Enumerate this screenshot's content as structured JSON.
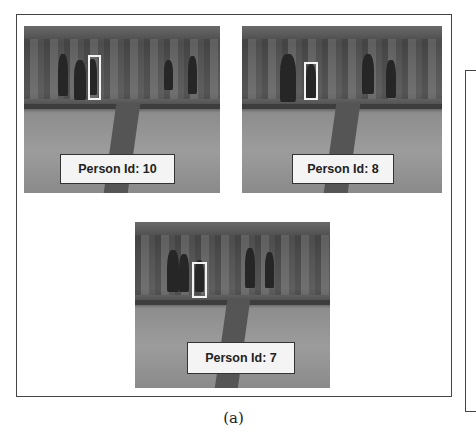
{
  "figure": {
    "caption": "(a)",
    "panels": [
      {
        "id": "top-left",
        "label": "Person Id: 10"
      },
      {
        "id": "top-right",
        "label": "Person Id: 8"
      },
      {
        "id": "bottom-center",
        "label": "Person Id: 7"
      }
    ]
  }
}
